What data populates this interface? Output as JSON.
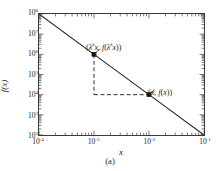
{
  "figure": {
    "caption": "(a)"
  },
  "axes": {
    "xlabel": "x",
    "ylabel": "f(x)",
    "x_ticks": [
      {
        "mantissa": "10",
        "exponent": "-4"
      },
      {
        "mantissa": "10",
        "exponent": "-3"
      },
      {
        "mantissa": "10",
        "exponent": "-2"
      },
      {
        "mantissa": "10",
        "exponent": "-1"
      }
    ],
    "y_ticks": [
      {
        "mantissa": "10",
        "exponent": "8"
      },
      {
        "mantissa": "10",
        "exponent": "7"
      },
      {
        "mantissa": "10",
        "exponent": "6"
      },
      {
        "mantissa": "10",
        "exponent": "5"
      },
      {
        "mantissa": "10",
        "exponent": "4"
      },
      {
        "mantissa": "10",
        "exponent": "3"
      },
      {
        "mantissa": "10",
        "exponent": "2"
      }
    ]
  },
  "annotations": {
    "upper": {
      "open": "(",
      "lambda": "λ",
      "lambda_exp": "k",
      "x1": "x",
      "comma": ", ",
      "f": "f",
      "inner_open": "(",
      "lambda2": "λ",
      "lambda2_exp": "k",
      "x2": "x",
      "inner_close": ")",
      "close": ")"
    },
    "lower": {
      "open": "(",
      "x1": "x",
      "comma": ", ",
      "f": "f",
      "inner_open": "(",
      "x2": "x",
      "inner_close": ")",
      "close": ")"
    }
  },
  "chart_data": {
    "type": "line",
    "title": "",
    "subtitle": "",
    "xlabel": "x",
    "ylabel": "f(x)",
    "xscale": "log",
    "yscale": "log",
    "xlim": [
      0.0001,
      0.1
    ],
    "ylim": [
      100,
      100000000
    ],
    "grid": false,
    "legend": null,
    "series": [
      {
        "name": "f(x) power law",
        "x": [
          0.0001,
          0.001,
          0.01,
          0.1
        ],
        "y": [
          100000000,
          1000000,
          10000,
          100
        ],
        "style": "solid",
        "color": "#2b2b2b"
      }
    ],
    "markers": [
      {
        "name": "scaled-point",
        "label": "(λ^k x, f(λ^k x))",
        "x": 0.001,
        "y": 1000000
      },
      {
        "name": "base-point",
        "label": "(x, f(x))",
        "x": 0.01,
        "y": 10000
      }
    ],
    "guides": [
      {
        "name": "vertical-dashed-guide",
        "style": "dashed",
        "from": {
          "x": 0.001,
          "y": 1000000
        },
        "to": {
          "x": 0.001,
          "y": 10000
        }
      },
      {
        "name": "horizontal-dashed-guide",
        "style": "dashed",
        "from": {
          "x": 0.001,
          "y": 10000
        },
        "to": {
          "x": 0.01,
          "y": 10000
        }
      }
    ]
  }
}
